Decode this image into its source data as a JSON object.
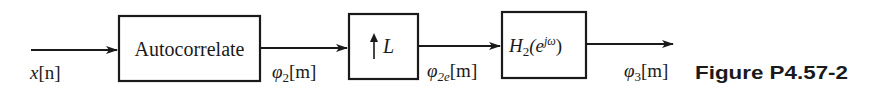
{
  "diagram": {
    "type": "block-diagram",
    "caption": "Figure P4.57-2",
    "blocks": [
      {
        "id": "autocorrelate",
        "label": "Autocorrelate"
      },
      {
        "id": "upsampler",
        "label_arrow": "↑",
        "label": "L"
      },
      {
        "id": "filter",
        "label_main": "H",
        "label_sub": "2",
        "label_paren_open": "(e",
        "label_sup": "jω",
        "label_paren_close": ")"
      }
    ],
    "signals": [
      {
        "id": "input",
        "main": "x",
        "bracket": "[n]"
      },
      {
        "id": "phi2",
        "main": "φ",
        "sub": "2",
        "bracket": "[m]"
      },
      {
        "id": "phi2e",
        "main": "φ",
        "sub": "2e",
        "bracket": "[m]"
      },
      {
        "id": "phi3",
        "main": "φ",
        "sub": "3",
        "bracket": "[m]"
      }
    ],
    "colors": {
      "stroke": "#1a1a1a",
      "background": "#ffffff"
    }
  }
}
